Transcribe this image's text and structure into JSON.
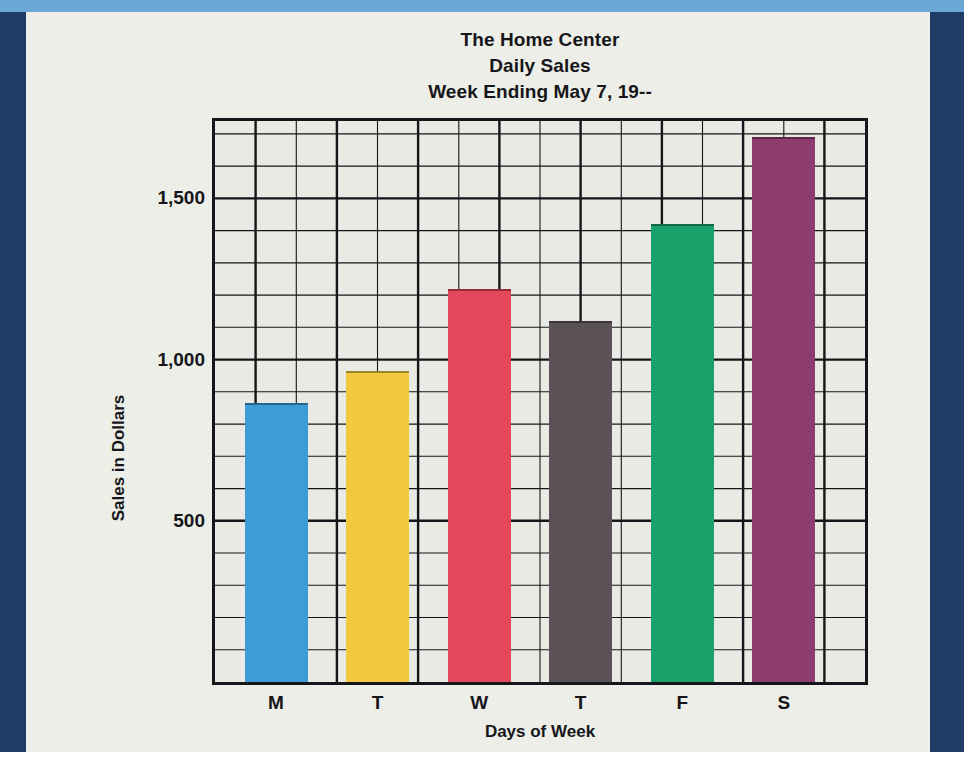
{
  "figure": {
    "title_line1": "The Home Center",
    "title_line2": "Daily Sales",
    "title_line3": "Week Ending May 7, 19--"
  },
  "axes": {
    "ylabel": "Sales in Dollars",
    "xlabel": "Days of Week",
    "ytick_labels": [
      "1,500",
      "1,000",
      "500"
    ]
  },
  "colors": {
    "monday": "#3d9bd6",
    "tuesday": "#f0c93c",
    "wednesday": "#e4465a",
    "thursday": "#5b5258",
    "friday": "#1aa06b",
    "saturday": "#8e3b6e",
    "frame": "#15161a",
    "paper": "#eceee7",
    "plot_bg": "#e9eae4",
    "band_navy": "#1e3c64",
    "band_blue": "#6ba8d6"
  },
  "chart_data": {
    "type": "bar",
    "title": "The Home Center Daily Sales Week Ending May 7, 19--",
    "xlabel": "Days of Week",
    "ylabel": "Sales in Dollars",
    "categories": [
      "M",
      "T",
      "W",
      "T",
      "F",
      "S"
    ],
    "category_names": [
      "Monday",
      "Tuesday",
      "Wednesday",
      "Thursday",
      "Friday",
      "Saturday"
    ],
    "values": [
      865,
      965,
      1220,
      1120,
      1420,
      1690
    ],
    "bar_colors": [
      "#3d9bd6",
      "#f0c93c",
      "#e4465a",
      "#5b5258",
      "#1aa06b",
      "#8e3b6e"
    ],
    "ylim": [
      0,
      1740
    ],
    "yticks": [
      500,
      1000,
      1500
    ],
    "ytick_labels": [
      "500",
      "1,000",
      "1,500"
    ],
    "grid": "on",
    "grid_minor_step": 100,
    "grid_major_step": 500,
    "legend": "none"
  }
}
